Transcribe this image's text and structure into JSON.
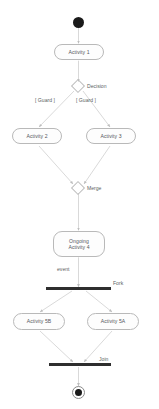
{
  "diagram": {
    "type": "uml-activity-diagram",
    "canvas": {
      "width": 159,
      "height": 409,
      "background": "#ffffff"
    },
    "colors": {
      "node_stroke": "#b9b9b9",
      "node_fill": "#fdfdfd",
      "text": "#53565a",
      "edge": "#c8c8c8",
      "bar": "#2e2e2e",
      "terminal": "#1a1a1a"
    }
  },
  "nodes": {
    "initial": {
      "name": "",
      "kind": "initial-node"
    },
    "activity1": {
      "label": "Activity 1",
      "kind": "activity"
    },
    "decision": {
      "label": "Decision",
      "kind": "decision"
    },
    "guard_left": {
      "label": "[ Guard ]",
      "kind": "guard"
    },
    "guard_right": {
      "label": "[ Guard ]",
      "kind": "guard"
    },
    "activity2": {
      "label": "Activity 2",
      "kind": "activity"
    },
    "activity3": {
      "label": "Activity 3",
      "kind": "activity"
    },
    "merge": {
      "label": "Merge",
      "kind": "merge"
    },
    "activity4": {
      "label": "Ongoing\nActivity 4",
      "kind": "activity"
    },
    "event": {
      "label": "event",
      "kind": "edge-label"
    },
    "fork": {
      "label": "Fork",
      "kind": "fork-bar"
    },
    "activity5b": {
      "label": "Activity 5B",
      "kind": "activity"
    },
    "activity5a": {
      "label": "Activity 5A",
      "kind": "activity"
    },
    "join": {
      "label": "Join",
      "kind": "join-bar"
    },
    "final": {
      "name": "",
      "kind": "final-node"
    }
  },
  "flow": [
    {
      "from": "initial",
      "to": "activity1"
    },
    {
      "from": "activity1",
      "to": "decision"
    },
    {
      "from": "decision",
      "to": "activity2",
      "guard": "[ Guard ]"
    },
    {
      "from": "decision",
      "to": "activity3",
      "guard": "[ Guard ]"
    },
    {
      "from": "activity2",
      "to": "merge"
    },
    {
      "from": "activity3",
      "to": "merge"
    },
    {
      "from": "merge",
      "to": "activity4"
    },
    {
      "from": "activity4",
      "to": "fork",
      "label": "event"
    },
    {
      "from": "fork",
      "to": "activity5b"
    },
    {
      "from": "fork",
      "to": "activity5a"
    },
    {
      "from": "activity5b",
      "to": "join"
    },
    {
      "from": "activity5a",
      "to": "join"
    },
    {
      "from": "join",
      "to": "final"
    }
  ]
}
